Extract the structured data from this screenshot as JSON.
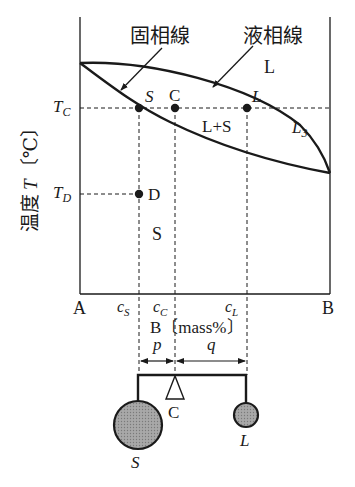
{
  "diagram": {
    "type": "binary phase diagram (complete solid solubility) with lever rule",
    "axis": {
      "y_label_jp": "温度",
      "y_symbol": "T",
      "y_unit": "〔℃〕",
      "x_left": "A",
      "x_right": "B",
      "x_unit": "B〔mass%〕",
      "x_ticks": [
        {
          "main": "c",
          "sub": "S"
        },
        {
          "main": "c",
          "sub": "C"
        },
        {
          "main": "c",
          "sub": "L"
        }
      ],
      "y_ticks": [
        {
          "main": "T",
          "sub": "C"
        },
        {
          "main": "T",
          "sub": "D"
        }
      ]
    },
    "curves": {
      "solidus_label": "固相線",
      "liquidus_label": "液相線",
      "l3_main": "L",
      "l3_sub": "3"
    },
    "regions": {
      "liquid": "L",
      "two_phase": "L+S",
      "solid": "S"
    },
    "points": {
      "s": "S",
      "c": "C",
      "l": "L",
      "d": "D"
    },
    "lever": {
      "p": "p",
      "q": "q",
      "fulcrum": "C",
      "left_mass": "S",
      "right_mass": "L"
    },
    "colors": {
      "line": "#1a1a1a",
      "mass_fill": "#9a9a9a",
      "background": "#ffffff"
    }
  }
}
